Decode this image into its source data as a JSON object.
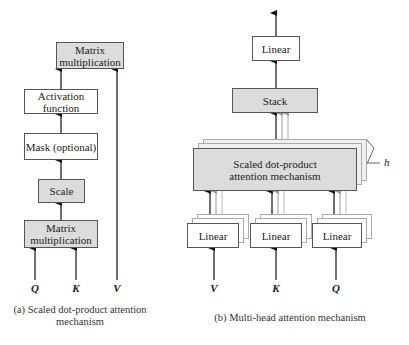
{
  "left_diagram": {
    "boxes": {
      "matmul_top": "Matrix multiplication",
      "activation": "Activation function",
      "mask": "Mask (optional)",
      "scale": "Scale",
      "matmul_bottom": "Matrix multiplication"
    },
    "inputs": [
      "Q",
      "K",
      "V"
    ],
    "caption": "(a) Scaled dot-product attention mechanism"
  },
  "right_diagram": {
    "boxes": {
      "linear_top": "Linear",
      "stack": "Stack",
      "attention": "Scaled dot-product attention mechanism",
      "linear_v": "Linear",
      "linear_k": "Linear",
      "linear_q": "Linear"
    },
    "heads_label": "h",
    "inputs": [
      "V",
      "K",
      "Q"
    ],
    "caption": "(b) Multi-head attention mechanism"
  }
}
